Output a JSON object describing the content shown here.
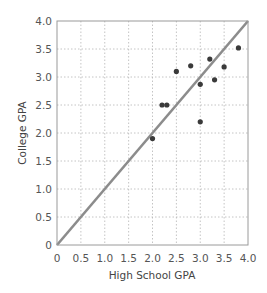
{
  "chart_data": {
    "type": "scatter",
    "title": "",
    "xlabel": "High School GPA",
    "ylabel": "College GPA",
    "xlim": [
      0,
      4.0
    ],
    "ylim": [
      0,
      4.0
    ],
    "grid": true,
    "x_ticks": [
      "0",
      "0.5",
      "1.0",
      "1.5",
      "2.0",
      "2.5",
      "3.0",
      "3.5",
      "4.0"
    ],
    "y_ticks": [
      "0",
      "0.5",
      "1.0",
      "1.5",
      "2.0",
      "2.5",
      "3.0",
      "3.5",
      "4.0"
    ],
    "reference_line": {
      "label": "y = x",
      "from": [
        0,
        0
      ],
      "to": [
        4.0,
        4.0
      ],
      "color": "#8c8c8c"
    },
    "series": [
      {
        "name": "Students",
        "color": "#3a3a3a",
        "points": [
          {
            "x": 2.0,
            "y": 1.9
          },
          {
            "x": 2.2,
            "y": 2.5
          },
          {
            "x": 2.3,
            "y": 2.5
          },
          {
            "x": 2.5,
            "y": 3.1
          },
          {
            "x": 2.8,
            "y": 3.2
          },
          {
            "x": 3.0,
            "y": 2.2
          },
          {
            "x": 3.0,
            "y": 2.87
          },
          {
            "x": 3.2,
            "y": 3.32
          },
          {
            "x": 3.3,
            "y": 2.95
          },
          {
            "x": 3.5,
            "y": 3.18
          },
          {
            "x": 3.8,
            "y": 3.52
          }
        ]
      }
    ]
  }
}
